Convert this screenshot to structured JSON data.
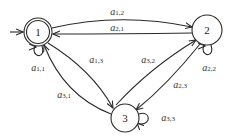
{
  "diagram": {
    "type": "state-transition-graph",
    "nodes": [
      {
        "id": "1",
        "label": "1",
        "initial": true,
        "accepting": true
      },
      {
        "id": "2",
        "label": "2",
        "initial": false,
        "accepting": false
      },
      {
        "id": "3",
        "label": "3",
        "initial": false,
        "accepting": false
      }
    ],
    "edges": [
      {
        "from": "1",
        "to": "2",
        "label_base": "a",
        "label_sub": "1,2"
      },
      {
        "from": "2",
        "to": "1",
        "label_base": "a",
        "label_sub": "2,1"
      },
      {
        "from": "1",
        "to": "1",
        "label_base": "a",
        "label_sub": "1,1"
      },
      {
        "from": "1",
        "to": "3",
        "label_base": "a",
        "label_sub": "1,3"
      },
      {
        "from": "3",
        "to": "1",
        "label_base": "a",
        "label_sub": "3,1"
      },
      {
        "from": "3",
        "to": "2",
        "label_base": "a",
        "label_sub": "3,2"
      },
      {
        "from": "2",
        "to": "3",
        "label_base": "a",
        "label_sub": "2,3"
      },
      {
        "from": "2",
        "to": "2",
        "label_base": "a",
        "label_sub": "2,2"
      },
      {
        "from": "3",
        "to": "3",
        "label_base": "a",
        "label_sub": "3,3"
      }
    ]
  }
}
